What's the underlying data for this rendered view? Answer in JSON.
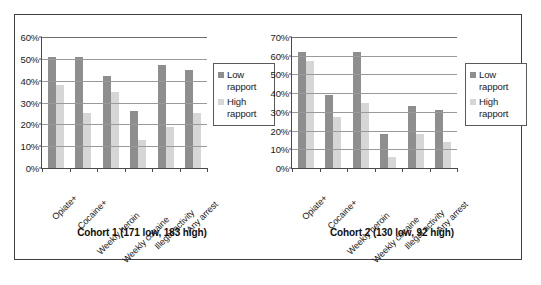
{
  "chart_data": [
    {
      "type": "bar",
      "title": "Cohort 1 (171 low, 183 high)",
      "xlabel": "",
      "ylabel": "",
      "ylim": [
        0,
        60
      ],
      "ytick_labels": [
        "60%",
        "50%",
        "40%",
        "30%",
        "20%",
        "10%",
        "0%"
      ],
      "ytick_values": [
        60,
        50,
        40,
        30,
        20,
        10,
        0
      ],
      "grid": true,
      "legend_position": "right",
      "categories": [
        "Opiate+",
        "Cocaine+",
        "Weekly heroin",
        "Weekly cocaine",
        "Illegal activity",
        "Any arrest"
      ],
      "series": [
        {
          "name": "Low rapport",
          "color": "#8e8e8e",
          "values": [
            51,
            51,
            42,
            26,
            47,
            45
          ]
        },
        {
          "name": "High rapport",
          "color": "#d6d6d6",
          "values": [
            38,
            25,
            35,
            13,
            19,
            25
          ]
        }
      ]
    },
    {
      "type": "bar",
      "title": "Cohort 2 (130 low, 92 high)",
      "xlabel": "",
      "ylabel": "",
      "ylim": [
        0,
        70
      ],
      "ytick_labels": [
        "70%",
        "60%",
        "50%",
        "40%",
        "30%",
        "20%",
        "10%",
        "0%"
      ],
      "ytick_values": [
        70,
        60,
        50,
        40,
        30,
        20,
        10,
        0
      ],
      "grid": true,
      "legend_position": "right",
      "categories": [
        "Opiate+",
        "Cocaine+",
        "Weekly heroin",
        "Weekly cocaine",
        "Illegal activity",
        "Any arrest"
      ],
      "series": [
        {
          "name": "Low rapport",
          "color": "#8e8e8e",
          "values": [
            62,
            39,
            62,
            18,
            33,
            31
          ]
        },
        {
          "name": "High rapport",
          "color": "#d6d6d6",
          "values": [
            57,
            27,
            35,
            6,
            18,
            14
          ]
        }
      ]
    }
  ],
  "figure": {
    "panels": [
      {
        "caption": "Cohort 1 (171 low, 183 high)",
        "yticks": [
          "60%",
          "50%",
          "40%",
          "30%",
          "20%",
          "10%",
          "0%"
        ],
        "xticks": [
          "Opiate+",
          "Cocaine+",
          "Weekly heroin",
          "Weekly cocaine",
          "Illegal activity",
          "Any arrest"
        ],
        "legend": [
          {
            "label_line1": "Low",
            "label_line2": "rapport"
          },
          {
            "label_line1": "High",
            "label_line2": "rapport"
          }
        ]
      },
      {
        "caption": "Cohort 2 (130 low, 92 high)",
        "yticks": [
          "70%",
          "60%",
          "50%",
          "40%",
          "30%",
          "20%",
          "10%",
          "0%"
        ],
        "xticks": [
          "Opiate+",
          "Cocaine+",
          "Weekly heroin",
          "Weekly cocaine",
          "Illegal activity",
          "Any arrest"
        ],
        "legend": [
          {
            "label_line1": "Low",
            "label_line2": "rapport"
          },
          {
            "label_line1": "High",
            "label_line2": "rapport"
          }
        ]
      }
    ],
    "colors": {
      "low_rapport": "#8e8e8e",
      "high_rapport": "#d6d6d6",
      "frame_border": "#3f3f3f",
      "axis": "#4a4a4a",
      "gridline": "#9a9a9a"
    }
  }
}
